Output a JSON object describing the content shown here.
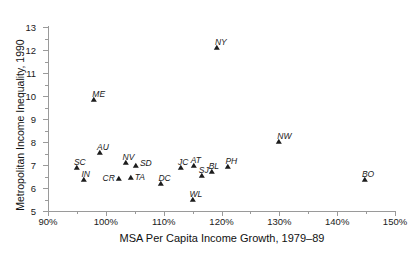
{
  "chart_data": {
    "type": "scatter",
    "title": "",
    "xlabel": "MSA Per Capita Income Growth, 1979–89",
    "ylabel": "Metropolitan Income Inequality, 1990",
    "xlim": [
      90,
      150
    ],
    "ylim": [
      5,
      13
    ],
    "grid": false,
    "legend": "none",
    "x_tick_labels": [
      "90%",
      "100%",
      "110%",
      "120%",
      "130%",
      "140%",
      "150%"
    ],
    "x_major_ticks": [
      90,
      100,
      110,
      120,
      130,
      140,
      150
    ],
    "x_minor_ticks": [
      95,
      105,
      115,
      125,
      135,
      145
    ],
    "y_tick_labels": [
      "5",
      "6",
      "7",
      "8",
      "9",
      "10",
      "11",
      "12",
      "13"
    ],
    "y_major_ticks": [
      5,
      6,
      7,
      8,
      9,
      10,
      11,
      12,
      13
    ],
    "y_minor_ticks": [
      5.5,
      6.5,
      7.5,
      8.5,
      9.5,
      10.5,
      11.5,
      12.5
    ],
    "x_unit": "%",
    "marker": "triangle",
    "marker_color": "#1c1c1c",
    "axis_color": "#9a9a9a",
    "points": [
      {
        "label": "ME",
        "x": 98.0,
        "y": 9.75,
        "lx": -2,
        "ly": -13
      },
      {
        "label": "NY",
        "x": 119.2,
        "y": 12.0,
        "lx": -2,
        "ly": -13
      },
      {
        "label": "NW",
        "x": 130.0,
        "y": 7.9,
        "lx": -2,
        "ly": -13
      },
      {
        "label": "AU",
        "x": 99.0,
        "y": 7.45,
        "lx": -3,
        "ly": -13
      },
      {
        "label": "SC",
        "x": 95.0,
        "y": 6.8,
        "lx": -3,
        "ly": -13
      },
      {
        "label": "NV",
        "x": 103.4,
        "y": 7.0,
        "lx": -3,
        "ly": -13
      },
      {
        "label": "SD",
        "x": 105.2,
        "y": 6.88,
        "lx": 4,
        "ly": -10
      },
      {
        "label": "IN",
        "x": 96.3,
        "y": 6.25,
        "lx": -3,
        "ly": -13
      },
      {
        "label": "CR",
        "x": 102.2,
        "y": 6.3,
        "lx": -16,
        "ly": -8
      },
      {
        "label": "TA",
        "x": 104.3,
        "y": 6.35,
        "lx": 4,
        "ly": -8
      },
      {
        "label": "DC",
        "x": 109.6,
        "y": 6.1,
        "lx": -3,
        "ly": -13
      },
      {
        "label": "JC",
        "x": 113.0,
        "y": 6.78,
        "lx": -3,
        "ly": -13
      },
      {
        "label": "AT",
        "x": 115.2,
        "y": 6.88,
        "lx": -3,
        "ly": -13
      },
      {
        "label": "SJ",
        "x": 116.6,
        "y": 6.42,
        "lx": -3,
        "ly": -13
      },
      {
        "label": "BL",
        "x": 118.3,
        "y": 6.62,
        "lx": -3,
        "ly": -13
      },
      {
        "label": "PH",
        "x": 121.2,
        "y": 6.82,
        "lx": -3,
        "ly": -13
      },
      {
        "label": "WL",
        "x": 115.0,
        "y": 5.4,
        "lx": -3,
        "ly": -13
      },
      {
        "label": "BO",
        "x": 144.8,
        "y": 6.28,
        "lx": -3,
        "ly": -13
      }
    ]
  }
}
